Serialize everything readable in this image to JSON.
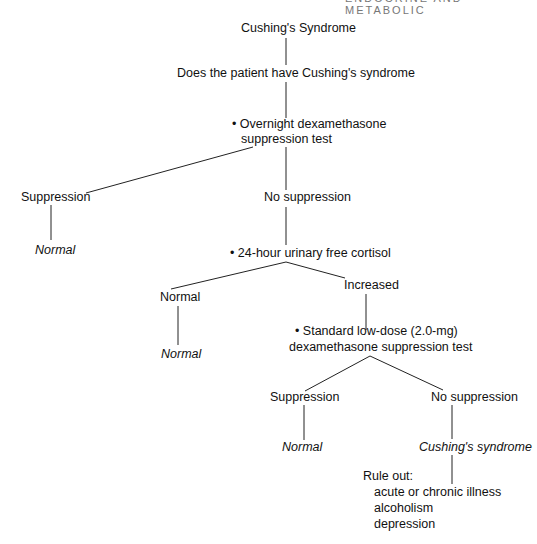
{
  "header": "ENDOCRINE AND METABOLIC",
  "nodes": {
    "root": "Cushing's Syndrome",
    "question": "Does the patient have Cushing's syndrome",
    "test1_l1": "• Overnight dexamethasone",
    "test1_l2": "suppression test",
    "t1_supp": "Suppression",
    "t1_supp_result": "Normal",
    "t1_nosupp": "No suppression",
    "test2": "• 24-hour urinary free cortisol",
    "t2_normal": "Normal",
    "t2_normal_result": "Normal",
    "t2_increased": "Increased",
    "test3_l1": "• Standard low-dose (2.0-mg)",
    "test3_l2": "dexamethasone suppression test",
    "t3_supp": "Suppression",
    "t3_supp_result": "Normal",
    "t3_nosupp": "No suppression",
    "t3_nosupp_result": "Cushing's syndrome",
    "ruleout": "Rule out:",
    "ruleout_items": [
      "acute or chronic illness",
      "alcoholism",
      "depression"
    ]
  }
}
